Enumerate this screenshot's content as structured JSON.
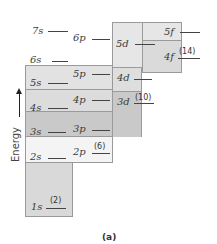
{
  "diagram": {
    "axis_label": "Energy",
    "caption": "(a)",
    "colors": {
      "n1_box": "#d9d9d9",
      "n2_row": "#f2f2f2",
      "n3_row": "#c8c8c8",
      "n4_row": "#dedede",
      "n5_row": "#e4e4e4",
      "top_box": "#e6e6e6"
    },
    "levels": {
      "s1": "1s",
      "s2": "2s",
      "p2": "2p",
      "s3": "3s",
      "p3": "3p",
      "d3": "3d",
      "s4": "4s",
      "p4": "4p",
      "d4": "4d",
      "f4": "4f",
      "s5": "5s",
      "p5": "5p",
      "d5": "5d",
      "f5": "5f",
      "s6": "6s",
      "p6": "6p",
      "s7": "7s"
    },
    "capacities": {
      "s": "(2)",
      "p": "(6)",
      "d": "(10)",
      "f": "(14)"
    }
  }
}
